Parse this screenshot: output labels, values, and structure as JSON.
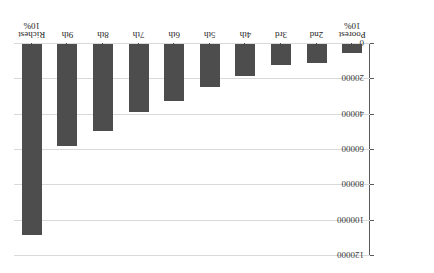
{
  "chart_data": {
    "type": "bar",
    "title": "",
    "xlabel": "",
    "ylabel": "",
    "categories": [
      "Richest\n10%",
      "9th",
      "8th",
      "7th",
      "6th",
      "5th",
      "4th",
      "3rd",
      "2nd",
      "Poorest\n10%"
    ],
    "values": [
      108000,
      58000,
      49000,
      38500,
      32500,
      24500,
      18000,
      12000,
      11000,
      5000
    ],
    "ytick_labels": [
      "0",
      "20000",
      "40000",
      "60000",
      "80000",
      "100000",
      "120000"
    ],
    "ytick_values": [
      0,
      20000,
      40000,
      60000,
      80000,
      100000,
      120000
    ],
    "ylim": [
      0,
      120000
    ],
    "grid": true,
    "legend": "none",
    "bar_color": "#4d4d4d",
    "grid_color": "#d9d9d9",
    "axis_color": "#4a4a4a",
    "orientation": "rotated-180"
  }
}
